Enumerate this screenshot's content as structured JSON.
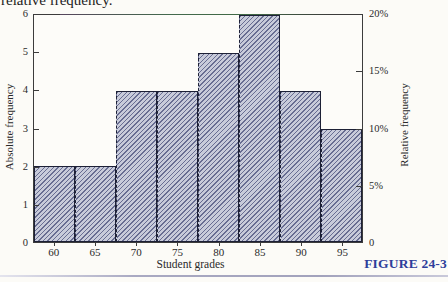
{
  "page": {
    "top_text": "relative frequency.",
    "figure_label": "FIGURE 24-3",
    "figure_label_color": "#2e3e9b",
    "bottom_rule_color": "#a6a6c0"
  },
  "chart_data": {
    "type": "bar",
    "title": "",
    "xlabel": "Student grades",
    "ylabel_left": "Absolute frequency",
    "ylabel_right": "Relative frequency",
    "categories": [
      "60",
      "65",
      "70",
      "75",
      "80",
      "85",
      "90",
      "95"
    ],
    "values": [
      2,
      2,
      4,
      4,
      5,
      6,
      4,
      3
    ],
    "left_axis_ticks": [
      "0",
      "1",
      "2",
      "3",
      "4",
      "5",
      "6"
    ],
    "right_axis_ticks": [
      "0",
      "5%",
      "10%",
      "15%",
      "20%"
    ],
    "ylim_left": [
      0,
      6
    ],
    "ylim_right_percent": [
      0,
      20
    ],
    "grid": false,
    "bar_fill_color": "#c8cbda",
    "bar_hatch_color": "#686d92",
    "bar_border_color": "#1d2036",
    "hatch_style": "diagonal-forward"
  }
}
